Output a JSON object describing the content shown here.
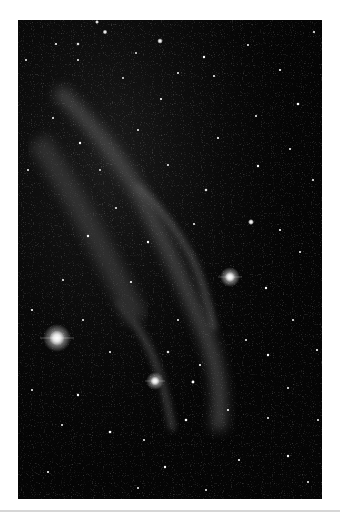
{
  "image": {
    "subject": "astronomical photograph of a faint emission nebula in a dense star field",
    "colors": {
      "page_background": "#ffffff",
      "sky": "#050505",
      "nebula": "#5a5a5a",
      "star": "#ffffff",
      "separator": "#d6d6d6"
    },
    "bright_stars": [
      {
        "x": 39,
        "y": 318,
        "r": 7.5
      },
      {
        "x": 212,
        "y": 257,
        "r": 5
      },
      {
        "x": 137,
        "y": 361,
        "r": 4.5
      },
      {
        "x": 233,
        "y": 202,
        "r": 3
      },
      {
        "x": 142,
        "y": 21,
        "r": 2.8
      },
      {
        "x": 87,
        "y": 12,
        "r": 2.4
      },
      {
        "x": 79,
        "y": 2,
        "r": 2
      }
    ]
  }
}
